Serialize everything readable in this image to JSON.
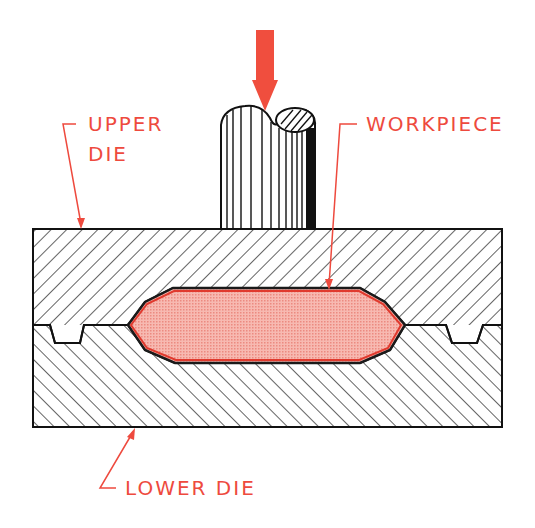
{
  "diagram": {
    "colors": {
      "label": "#ee4a3e",
      "arrow": "#f04e3e",
      "workpiece_fill": "#f4a8a0",
      "workpiece_edge": "#e03a2e",
      "outline": "#111111"
    },
    "labels": {
      "upper_die_line1": "UPPER",
      "upper_die_line2": "DIE",
      "workpiece": "WORKPIECE",
      "lower_die": "LOWER DIE"
    },
    "components": [
      {
        "id": "force-arrow",
        "description": "Downward force arrow"
      },
      {
        "id": "ram",
        "description": "Cylindrical ram / punch (broken-off top)"
      },
      {
        "id": "upper-die",
        "description": "Upper die, hatched"
      },
      {
        "id": "lower-die",
        "description": "Lower die, hatched opposite direction"
      },
      {
        "id": "workpiece",
        "description": "Workpiece in die cavity"
      },
      {
        "id": "flash-gutters",
        "description": "Flash gutters at left and right of parting line"
      }
    ]
  }
}
